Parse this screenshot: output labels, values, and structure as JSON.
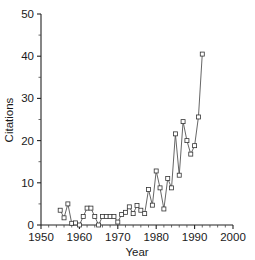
{
  "chart_data": {
    "type": "line",
    "title": "",
    "xlabel": "Year",
    "ylabel": "Citations",
    "xlim": [
      1950,
      2000
    ],
    "ylim": [
      0,
      50
    ],
    "xticks": [
      1950,
      1960,
      1970,
      1980,
      1990,
      2000
    ],
    "yticks": [
      0,
      10,
      20,
      30,
      40,
      50
    ],
    "xtick_labels": [
      "1950",
      "1960",
      "1970",
      "1980",
      "1990",
      "2000"
    ],
    "ytick_labels": [
      "0",
      "10",
      "20",
      "30",
      "40",
      "50"
    ],
    "xminor_step": 2,
    "yminor_step": 5,
    "grid": false,
    "legend": null,
    "marker": "square",
    "line_color": "#555555",
    "marker_face_color": "#ffffff",
    "marker_edge_color": "#333333",
    "x": [
      1955,
      1956,
      1957,
      1958,
      1959,
      1960,
      1961,
      1962,
      1963,
      1964,
      1965,
      1966,
      1967,
      1968,
      1969,
      1970,
      1971,
      1972,
      1973,
      1974,
      1975,
      1976,
      1977,
      1978,
      1979,
      1980,
      1981,
      1982,
      1983,
      1984,
      1985,
      1986,
      1987,
      1988,
      1989,
      1990,
      1991,
      1992
    ],
    "values": [
      3.5,
      1.7,
      5.0,
      0.4,
      0.5,
      0.0,
      2.0,
      4.0,
      4.0,
      2.0,
      0.0,
      2.0,
      2.0,
      2.0,
      2.0,
      0.7,
      2.5,
      3.0,
      4.3,
      2.7,
      4.6,
      3.5,
      2.7,
      8.4,
      4.7,
      12.8,
      8.8,
      3.8,
      11.0,
      8.8,
      21.6,
      11.8,
      24.5,
      20.0,
      16.8,
      18.8,
      25.6,
      40.5
    ],
    "series": [
      {
        "name": "Citations",
        "values": [
          3.5,
          1.7,
          5.0,
          0.4,
          0.5,
          0.0,
          2.0,
          4.0,
          4.0,
          2.0,
          0.0,
          2.0,
          2.0,
          2.0,
          2.0,
          0.7,
          2.5,
          3.0,
          4.3,
          2.7,
          4.6,
          3.5,
          2.7,
          8.4,
          4.7,
          12.8,
          8.8,
          3.8,
          11.0,
          8.8,
          21.6,
          11.8,
          24.5,
          20.0,
          16.8,
          18.8,
          25.6,
          40.5
        ]
      }
    ]
  }
}
